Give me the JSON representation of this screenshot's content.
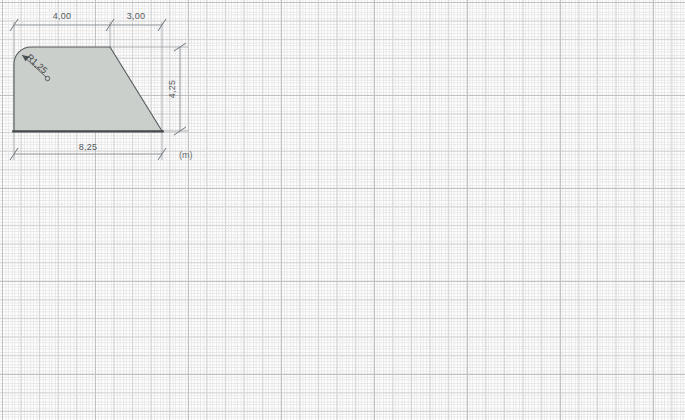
{
  "drawing": {
    "title": "Cross-section profile",
    "unit_label": "(m)",
    "shape": {
      "name": "trapezoid-with-fillet",
      "fill_color": "#cbcfcc",
      "stroke_color": "#4a4f52",
      "description": "Closed polygon: rounded top-left corner, flat top, chamfered right side, flat base"
    },
    "dimensions": [
      {
        "id": "top-left-span",
        "label": "4,00",
        "value": 4.0,
        "orientation": "horizontal",
        "position": "top"
      },
      {
        "id": "top-right-span",
        "label": "3,00",
        "value": 3.0,
        "orientation": "horizontal",
        "position": "top"
      },
      {
        "id": "overall-height",
        "label": "4,25",
        "value": 4.25,
        "orientation": "vertical",
        "position": "right"
      },
      {
        "id": "overall-width",
        "label": "8,25",
        "value": 8.25,
        "orientation": "horizontal",
        "position": "bottom"
      }
    ],
    "annotations": [
      {
        "id": "fillet-radius",
        "label": "R1,25",
        "value": 1.25,
        "type": "radius-leader"
      }
    ],
    "grid": {
      "minor_spacing_px": 6.2,
      "major_spacing_px": 18.6,
      "minor_color": "#d9d9d9",
      "major_color": "#c9c9c9",
      "visible": true
    }
  }
}
